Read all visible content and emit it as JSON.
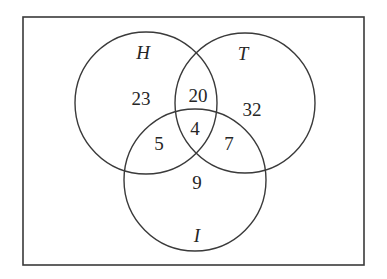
{
  "diagram": {
    "type": "venn-3-set",
    "frame": {
      "x": 23,
      "y": 17,
      "width": 341,
      "height": 248,
      "stroke": "#3a3a3a"
    },
    "sets": [
      {
        "id": "H",
        "label": "H",
        "cx": 146,
        "cy": 103,
        "r": 71,
        "label_x": 143,
        "label_y": 52
      },
      {
        "id": "T",
        "label": "T",
        "cx": 245,
        "cy": 103,
        "r": 70,
        "label_x": 243,
        "label_y": 53
      },
      {
        "id": "I",
        "label": "I",
        "cx": 195,
        "cy": 180,
        "r": 71,
        "label_x": 197,
        "label_y": 235
      }
    ],
    "regions": [
      {
        "id": "H_only",
        "sets": [
          "H"
        ],
        "value": "23",
        "x": 141,
        "y": 98
      },
      {
        "id": "H_T_only",
        "sets": [
          "H",
          "T"
        ],
        "value": "20",
        "x": 198,
        "y": 95
      },
      {
        "id": "T_only",
        "sets": [
          "T"
        ],
        "value": "32",
        "x": 252,
        "y": 109
      },
      {
        "id": "H_T_I",
        "sets": [
          "H",
          "T",
          "I"
        ],
        "value": "4",
        "x": 195,
        "y": 128
      },
      {
        "id": "H_I_only",
        "sets": [
          "H",
          "I"
        ],
        "value": "5",
        "x": 159,
        "y": 143
      },
      {
        "id": "T_I_only",
        "sets": [
          "T",
          "I"
        ],
        "value": "7",
        "x": 229,
        "y": 143
      },
      {
        "id": "I_only",
        "sets": [
          "I"
        ],
        "value": "9",
        "x": 197,
        "y": 182
      }
    ]
  }
}
